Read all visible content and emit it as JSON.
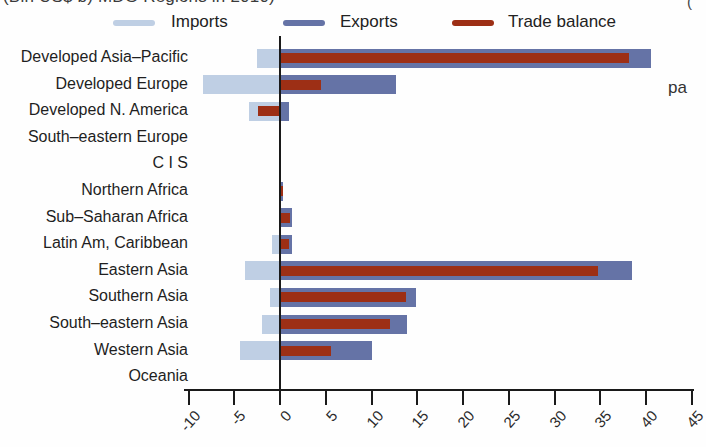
{
  "page": {
    "width": 697,
    "height": 447,
    "background": "#fefefe"
  },
  "title": {
    "text": "(Bln US$ b) MDG Regions in 2010)",
    "visibility": "cropped-at-top-edge"
  },
  "legend": {
    "items": [
      {
        "label": "Imports",
        "color": "#bfcfe4"
      },
      {
        "label": "Exports",
        "color": "#6573a6"
      },
      {
        "label": "Trade balance",
        "color": "#9d2f15"
      }
    ]
  },
  "edge_fragments": {
    "right_text": "pa",
    "top_right_mark": "("
  },
  "chart_data": {
    "type": "bar",
    "orientation": "horizontal",
    "title": "(Bln US$ b) MDG Regions in 2010)",
    "legend_position": "top",
    "grid": false,
    "xlim": [
      -10,
      45
    ],
    "x_ticks": [
      -10,
      -5,
      0,
      5,
      10,
      15,
      20,
      25,
      30,
      35,
      40,
      45
    ],
    "categories": [
      "Developed Asia–Pacific",
      "Developed Europe",
      "Developed N. America",
      "South–eastern Europe",
      "C I S",
      "Northern Africa",
      "Sub–Saharan Africa",
      "Latin Am, Caribbean",
      "Eastern Asia",
      "Southern Asia",
      "South–eastern Asia",
      "Western Asia",
      "Oceania"
    ],
    "series": [
      {
        "name": "Imports",
        "color": "#bfcfe4",
        "values": [
          -2.5,
          -8.4,
          -3.4,
          0,
          0,
          -0.1,
          -0.1,
          -0.9,
          -3.8,
          -1.1,
          -2.0,
          -4.4,
          0
        ]
      },
      {
        "name": "Exports",
        "color": "#6573a6",
        "values": [
          40.6,
          12.7,
          1.0,
          0,
          0,
          0.2,
          1.3,
          1.3,
          38.5,
          14.9,
          13.9,
          10.1,
          0
        ]
      },
      {
        "name": "Trade balance",
        "color": "#9d2f15",
        "values": [
          38.1,
          4.5,
          -2.4,
          0,
          0,
          0.1,
          1.1,
          1.0,
          34.7,
          13.8,
          12.0,
          5.6,
          0
        ]
      }
    ]
  },
  "axis": {
    "tick_labels": [
      "-10",
      "-5",
      "0",
      "5",
      "10",
      "15",
      "20",
      "25",
      "30",
      "35",
      "40",
      "45"
    ]
  }
}
